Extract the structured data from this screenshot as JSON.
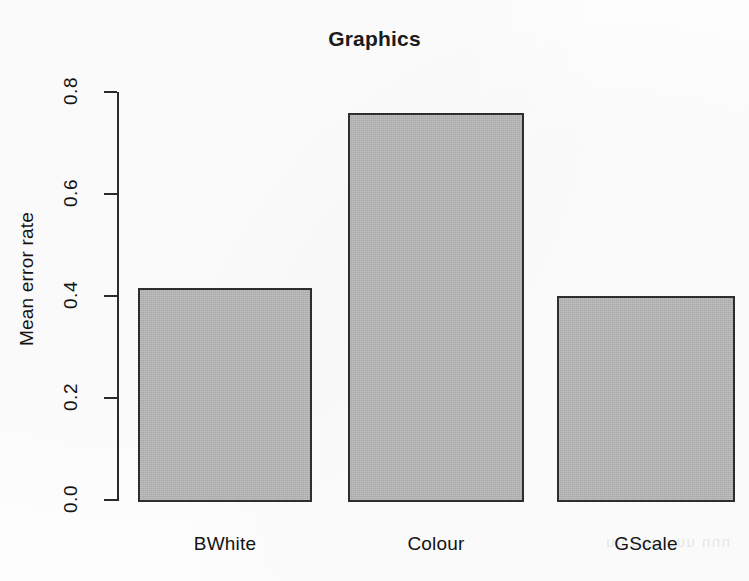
{
  "figure": {
    "width": 749,
    "height": 581,
    "background_color": "#fdfdfd",
    "scan_bleed_text": "nnn  uuu    uuu     uu"
  },
  "chart_data": {
    "type": "bar",
    "title": "Graphics",
    "xlabel": "",
    "ylabel": "Mean error rate",
    "categories": [
      "BWhite",
      "Colour",
      "GScale"
    ],
    "values": [
      0.415,
      0.759,
      0.4
    ],
    "ylim": [
      0.0,
      0.8
    ],
    "ytick_labels": [
      "0.0",
      "0.2",
      "0.4",
      "0.6",
      "0.8"
    ],
    "ytick_values": [
      0.0,
      0.2,
      0.4,
      0.6,
      0.8
    ],
    "grid": false,
    "legend": "none",
    "bar_fill_color": "#b4b4b4",
    "bar_border_color": "#2e2e2e",
    "axis_color": "#2a2a2a",
    "text_color": "#131313"
  },
  "geometry": {
    "axis_x": 117,
    "baseline_y": 500,
    "top_y": 92,
    "px_per_unit": 510,
    "bars": [
      {
        "left": 138,
        "right": 312
      },
      {
        "left": 348,
        "right": 524
      },
      {
        "left": 557,
        "right": 735
      }
    ]
  }
}
